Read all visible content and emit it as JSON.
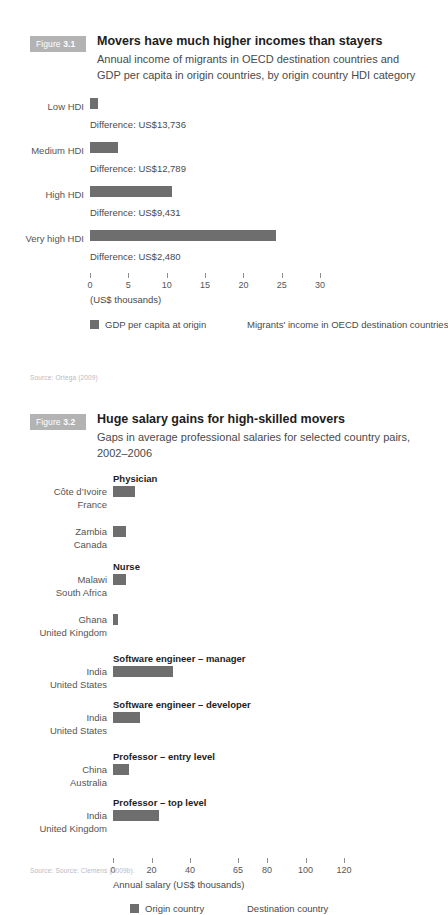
{
  "figure1": {
    "tag_prefix": "Figure ",
    "tag_number": "3.1",
    "title": "Movers have much higher incomes than stayers",
    "subtitle": "Annual income of migrants in OECD destination countries and GDP per capita in origin countries, by origin country HDI category",
    "source": "Source: Ortega (2009)",
    "legend": [
      {
        "label": "GDP per capita at origin",
        "color": "#6e6e6e"
      },
      {
        "label": "Migrants' income in OECD destination countries",
        "color": "#ffffff"
      }
    ],
    "axis_unit": "(US$ thousands)",
    "difference_prefix": "Difference: "
  },
  "figure2": {
    "tag_prefix": "Figure ",
    "tag_number": "3.2",
    "title": "Huge salary gains for high-skilled movers",
    "subtitle": "Gaps in average professional salaries for selected country pairs, 2002–2006",
    "source": "Source: Source: Clemens (2009b).",
    "axis_label": "Annual salary (US$ thousands)",
    "legend": [
      {
        "label": "Origin country",
        "color": "#6e6e6e"
      },
      {
        "label": "Destination country",
        "color": "#ffffff"
      }
    ]
  },
  "chart_data": [
    {
      "type": "bar",
      "id": "figure-3-1",
      "title": "Movers have much higher incomes than stayers",
      "subtitle": "Annual income of migrants in OECD destination countries and GDP per capita in origin countries, by origin country HDI category",
      "orientation": "horizontal",
      "xlabel": "(US$ thousands)",
      "ylabel": "",
      "xlim": [
        0,
        32
      ],
      "ticks": [
        0,
        5,
        10,
        15,
        20,
        25,
        30
      ],
      "tick_labels": [
        "0",
        "5",
        "10",
        "15",
        "20",
        "25",
        "30"
      ],
      "grid": false,
      "legend": [
        "GDP per capita at origin",
        "Migrants' income in OECD destination countries"
      ],
      "legend_position": "bottom",
      "categories": [
        "Low HDI",
        "Medium HDI",
        "High HDI",
        "Very high HDI"
      ],
      "values": [
        1.0,
        3.6,
        10.7,
        24.3
      ],
      "annotations": [
        "Difference: US$13,736",
        "Difference: US$12,789",
        "Difference: US$9,431",
        "Difference: US$2,480"
      ],
      "source": "Source: Ortega (2009)"
    },
    {
      "type": "bar",
      "id": "figure-3-2",
      "title": "Huge salary gains for high-skilled movers",
      "subtitle": "Gaps in average professional salaries for selected country pairs, 2002–2006",
      "orientation": "horizontal",
      "xlabel": "Annual salary (US$ thousands)",
      "ylabel": "",
      "xlim": [
        0,
        126
      ],
      "ticks": [
        0,
        20,
        40,
        65,
        80,
        100,
        120
      ],
      "tick_labels": [
        "0",
        "20",
        "40",
        "65",
        "80",
        "100",
        "120"
      ],
      "grid": false,
      "legend": [
        "Origin country",
        "Destination country"
      ],
      "legend_position": "bottom",
      "groups": [
        {
          "name": "Physician",
          "pairs": [
            {
              "origin": "Côte d’Ivoire",
              "destination": "France",
              "value": 11.5
            },
            {
              "origin": "Zambia",
              "destination": "Canada",
              "value": 6.5
            }
          ]
        },
        {
          "name": "Nurse",
          "pairs": [
            {
              "origin": "Malawi",
              "destination": "South Africa",
              "value": 6.5
            },
            {
              "origin": "Ghana",
              "destination": "United Kingdom",
              "value": 2.5
            }
          ]
        },
        {
          "name": "Software engineer – manager",
          "pairs": [
            {
              "origin": "India",
              "destination": "United States",
              "value": 31.0
            }
          ]
        },
        {
          "name": "Software engineer – developer",
          "pairs": [
            {
              "origin": "India",
              "destination": "United States",
              "value": 14.0
            }
          ]
        },
        {
          "name": "Professor – entry level",
          "pairs": [
            {
              "origin": "China",
              "destination": "Australia",
              "value": 8.5
            }
          ]
        },
        {
          "name": "Professor – top level",
          "pairs": [
            {
              "origin": "India",
              "destination": "United Kingdom",
              "value": 24.0
            }
          ]
        }
      ],
      "source": "Source: Source: Clemens (2009b)."
    }
  ]
}
